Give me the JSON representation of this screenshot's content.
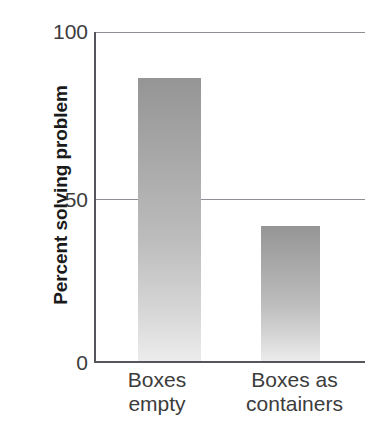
{
  "chart_data": {
    "type": "bar",
    "title": "",
    "subtitle": "",
    "xlabel": "",
    "ylabel": "Percent solving problem",
    "categories": [
      "Boxes\nempty",
      "Boxes as\ncontainers"
    ],
    "category_labels_flat": [
      "Boxes empty",
      "Boxes as containers"
    ],
    "values": [
      86,
      41
    ],
    "ylim": [
      0,
      100
    ],
    "yticks": [
      0,
      50,
      100
    ],
    "ytick_labels": [
      "0",
      "50",
      "100"
    ],
    "grid": "horizontal-gridlines-at-50-and-100",
    "legend": "none",
    "bar_fill": "vertical gradient dark gray top to light gray bottom",
    "colors": {
      "bar_top": "#959595",
      "bar_bottom": "#ececec",
      "gridline": "#8e8e96",
      "axis": "#55555c",
      "text": "#3c3c3c",
      "axis_title_text": "#1a1a1a",
      "background": "#ffffff"
    }
  },
  "axis": {
    "y_title": "Percent solving problem",
    "ticks": {
      "top": "100",
      "middle": "50",
      "bottom": "0"
    }
  },
  "bars": [
    {
      "label_line1": "Boxes",
      "label_line2": "empty",
      "value": 86
    },
    {
      "label_line1": "Boxes as",
      "label_line2": "containers",
      "value": 41
    }
  ],
  "category_text": {
    "boxes_empty": "Boxes\nempty",
    "boxes_containers": "Boxes as\ncontainers"
  }
}
